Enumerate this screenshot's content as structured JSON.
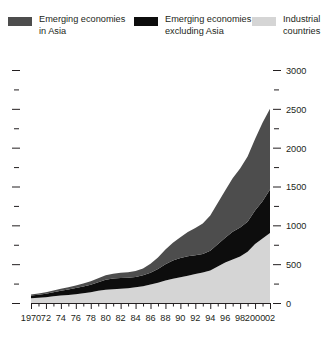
{
  "legend": {
    "items": [
      {
        "label": "Emerging economies\nin Asia",
        "color": "#4d4d4d",
        "name": "legend-emerging-asia"
      },
      {
        "label": "Emerging economies\nexcluding Asia",
        "color": "#0d0d0d",
        "name": "legend-emerging-ex-asia"
      },
      {
        "label": "Industrial\ncountries",
        "color": "#d5d5d5",
        "name": "legend-industrial"
      }
    ]
  },
  "chart_data": {
    "type": "area",
    "stacked": true,
    "title": "",
    "subtitle": "",
    "xlabel": "",
    "ylabel": "",
    "xlim": [
      1970,
      2002
    ],
    "ylim": [
      0,
      3000
    ],
    "grid": false,
    "legend_position": "top",
    "y_ticks_major": [
      0,
      500,
      1000,
      1500,
      2000,
      2500,
      3000
    ],
    "y_ticks_minor": [
      250,
      750,
      1250,
      1750,
      2250,
      2750
    ],
    "y_tick_labels": [
      "0",
      "500",
      "1000",
      "1500",
      "2000",
      "2500",
      "3000"
    ],
    "y_axis_side": "right",
    "x_tick_labels": [
      "1970",
      "72",
      "74",
      "76",
      "78",
      "80",
      "82",
      "84",
      "86",
      "88",
      "90",
      "92",
      "94",
      "96",
      "98",
      "2000",
      "02"
    ],
    "x": [
      1970,
      1971,
      1972,
      1973,
      1974,
      1975,
      1976,
      1977,
      1978,
      1979,
      1980,
      1981,
      1982,
      1983,
      1984,
      1985,
      1986,
      1987,
      1988,
      1989,
      1990,
      1991,
      1992,
      1993,
      1994,
      1995,
      1996,
      1997,
      1998,
      1999,
      2000,
      2001,
      2002
    ],
    "series": [
      {
        "name": "Industrial countries",
        "color": "#d5d5d5",
        "values": [
          60,
          66,
          74,
          86,
          96,
          104,
          114,
          126,
          140,
          158,
          172,
          178,
          182,
          190,
          202,
          216,
          238,
          262,
          290,
          312,
          330,
          352,
          372,
          392,
          420,
          470,
          520,
          560,
          600,
          660,
          760,
          830,
          900
        ]
      },
      {
        "name": "Emerging economies excluding Asia",
        "color": "#0d0d0d",
        "values": [
          36,
          40,
          46,
          54,
          62,
          70,
          78,
          86,
          96,
          110,
          128,
          138,
          140,
          136,
          134,
          140,
          150,
          176,
          208,
          236,
          248,
          250,
          244,
          240,
          254,
          286,
          320,
          356,
          372,
          386,
          430,
          480,
          560
        ]
      },
      {
        "name": "Emerging economies in Asia",
        "color": "#4d4d4d",
        "values": [
          14,
          16,
          18,
          22,
          26,
          30,
          34,
          38,
          44,
          50,
          58,
          62,
          66,
          70,
          76,
          88,
          116,
          148,
          190,
          228,
          268,
          312,
          350,
          392,
          452,
          530,
          610,
          690,
          760,
          840,
          920,
          1010,
          1040
        ]
      }
    ]
  }
}
